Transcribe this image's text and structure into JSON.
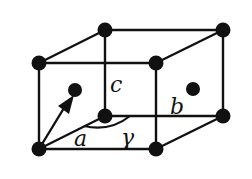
{
  "diagram": {
    "labels": {
      "a": "a",
      "b": "b",
      "c": "c",
      "gamma": "γ"
    },
    "colors": {
      "ink": "#111111",
      "background": "#ffffff"
    }
  }
}
